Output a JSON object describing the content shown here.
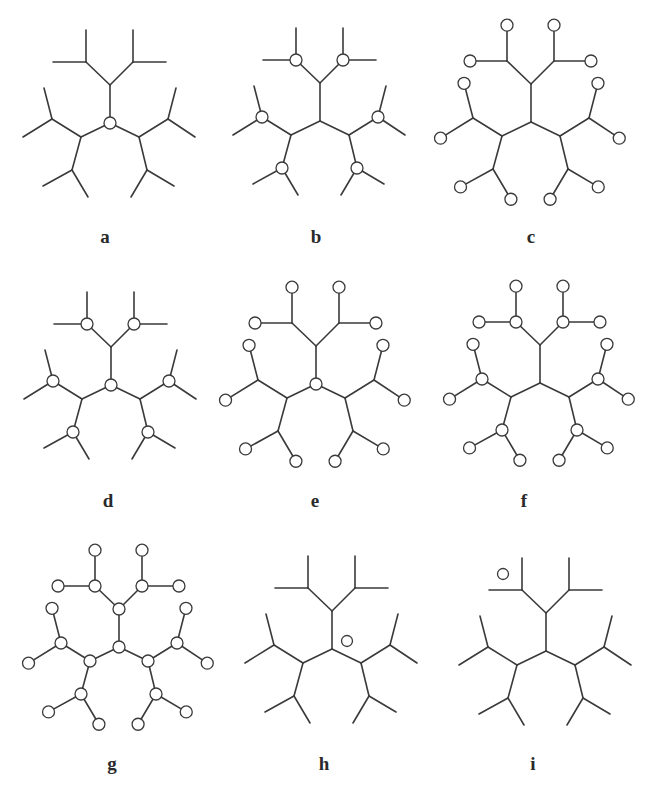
{
  "figure": {
    "colors": {
      "stroke": "#3a3a3a",
      "node_fill": "#ffffff",
      "label": "#2a2a2a"
    },
    "panels": [
      {
        "id": "a",
        "label": "a",
        "center": [
          110,
          123
        ],
        "leaf_scale": 1.0,
        "circles": [
          "root"
        ],
        "floating_circle": null,
        "label_pos": [
          105,
          240
        ]
      },
      {
        "id": "b",
        "label": "b",
        "center": [
          320,
          121
        ],
        "leaf_scale": 1.0,
        "circles": [
          "level2"
        ],
        "floating_circle": null,
        "label_pos": [
          316,
          240
        ]
      },
      {
        "id": "c",
        "label": "c",
        "center": [
          531,
          122
        ],
        "leaf_scale": 1.12,
        "circles": [
          "leaves"
        ],
        "floating_circle": null,
        "label_pos": [
          531,
          240
        ]
      },
      {
        "id": "d",
        "label": "d",
        "center": [
          111,
          385
        ],
        "leaf_scale": 1.0,
        "circles": [
          "root",
          "level2"
        ],
        "floating_circle": null,
        "label_pos": [
          108,
          504
        ]
      },
      {
        "id": "e",
        "label": "e",
        "center": [
          316,
          384
        ],
        "leaf_scale": 1.12,
        "circles": [
          "root",
          "leaves"
        ],
        "floating_circle": null,
        "label_pos": [
          315,
          504
        ]
      },
      {
        "id": "f",
        "label": "f",
        "center": [
          540,
          383
        ],
        "leaf_scale": 1.12,
        "circles": [
          "level2",
          "leaves"
        ],
        "floating_circle": null,
        "label_pos": [
          524,
          504
        ]
      },
      {
        "id": "g",
        "label": "g",
        "center": [
          119,
          647
        ],
        "leaf_scale": 1.12,
        "circles": [
          "root",
          "level1",
          "level2",
          "leaves"
        ],
        "floating_circle": null,
        "label_pos": [
          112,
          767
        ]
      },
      {
        "id": "h",
        "label": "h",
        "center": [
          332,
          649
        ],
        "leaf_scale": 1.0,
        "circles": [],
        "floating_circle": [
          347,
          641
        ],
        "label_pos": [
          324,
          767
        ]
      },
      {
        "id": "i",
        "label": "i",
        "center": [
          546,
          651
        ],
        "leaf_scale": 1.0,
        "circles": [],
        "floating_circle": [
          503,
          574
        ],
        "label_pos": [
          533,
          767
        ]
      }
    ],
    "tree": {
      "root": [
        0,
        0
      ],
      "level1": {
        "T": [
          0,
          -38
        ],
        "L": [
          -29,
          14
        ],
        "R": [
          29,
          14
        ]
      },
      "level2": {
        "TL": {
          "parent": "T",
          "pos": [
            -24,
            -61
          ],
          "leaves": [
            [
              -24,
              -93
            ],
            [
              -57,
              -61
            ]
          ]
        },
        "TR": {
          "parent": "T",
          "pos": [
            23,
            -61
          ],
          "leaves": [
            [
              23,
              -93
            ],
            [
              56,
              -61
            ]
          ]
        },
        "LU": {
          "parent": "L",
          "pos": [
            -58,
            -4
          ],
          "leaves": [
            [
              -66,
              -35
            ],
            [
              -87,
              14
            ]
          ]
        },
        "LD": {
          "parent": "L",
          "pos": [
            -38,
            47
          ],
          "leaves": [
            [
              -67,
              63
            ],
            [
              -22,
              74
            ]
          ]
        },
        "RU": {
          "parent": "R",
          "pos": [
            58,
            -4
          ],
          "leaves": [
            [
              66,
              -35
            ],
            [
              85,
              14
            ]
          ]
        },
        "RD": {
          "parent": "R",
          "pos": [
            37,
            47
          ],
          "leaves": [
            [
              21,
              74
            ],
            [
              64,
              63
            ]
          ]
        }
      },
      "node_radius": 6
    }
  }
}
